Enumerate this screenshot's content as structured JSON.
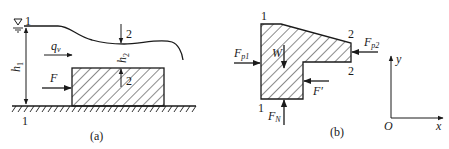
{
  "figure_a": {
    "caption": "(a)",
    "section_labels": {
      "top_left": "1",
      "bottom_left": "1",
      "surface_2": "2",
      "block_2": "2"
    },
    "depth_upstream": {
      "main": "h",
      "sub": "1"
    },
    "depth_downstream": {
      "main": "h",
      "sub": "2"
    },
    "flow_rate": {
      "main": "q",
      "sub": "v"
    },
    "force": "F",
    "water_surface_symbol": "free-surface-triangle"
  },
  "figure_b": {
    "caption": "(b)",
    "section_labels": {
      "top_left": "1",
      "bottom_left": "1",
      "top_right": "2",
      "bottom_right": "2"
    },
    "forces": {
      "fp1": {
        "main": "F",
        "sub": "p1"
      },
      "fp2": {
        "main": "F",
        "sub": "p2"
      },
      "weight": "W",
      "fprime": "F′",
      "fn": {
        "main": "F",
        "sub": "N"
      }
    }
  },
  "axes": {
    "origin": "O",
    "x_label": "x",
    "y_label": "y"
  },
  "colors": {
    "line": "#1a1a1a",
    "background": "#ffffff"
  }
}
